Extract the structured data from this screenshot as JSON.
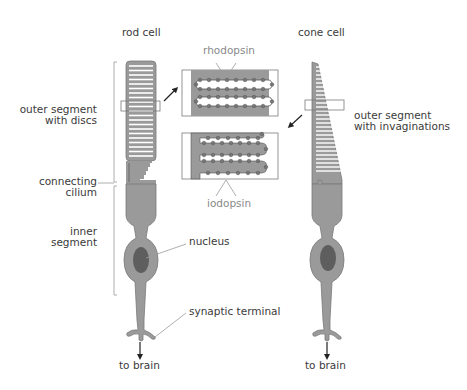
{
  "diagram": {
    "rod": {
      "title": "rod cell",
      "labels": {
        "outer_segment_1": "outer segment",
        "outer_segment_2": "with discs",
        "connecting_1": "connecting",
        "connecting_2": "cilium",
        "inner_1": "inner",
        "inner_2": "segment",
        "nucleus": "nucleus",
        "synaptic": "synaptic terminal",
        "to_brain": "to brain"
      }
    },
    "cone": {
      "title": "cone cell",
      "labels": {
        "outer_segment_1": "outer segment",
        "outer_segment_2": "with invaginations",
        "to_brain": "to brain"
      }
    },
    "inset": {
      "top_label": "rhodopsin",
      "bottom_label": "iodopsin"
    },
    "colors": {
      "cell_fill": "#9a9a9a",
      "cell_stroke": "#7a7a7a",
      "nucleus": "#5e5e5e",
      "disc": "#ffffff",
      "leader": "#9a9a9a",
      "text": "#3a3a3a",
      "protein_text": "#8a8a8a"
    }
  }
}
